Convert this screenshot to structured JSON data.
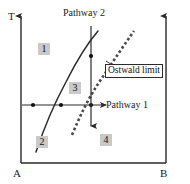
{
  "figure": {
    "type": "phase-diagram",
    "background_color": "#ffffff",
    "line_color": "#2a2a2a",
    "region_box_color": "#c9c9c9"
  },
  "axes": {
    "y_axis_label": "T",
    "x_axis_left_label": "A",
    "x_axis_right_label": "B",
    "left_axis_has_arrow": true,
    "right_axis_has_arrow": true
  },
  "regions": [
    {
      "id": "region-1",
      "label": "1"
    },
    {
      "id": "region-2",
      "label": "2"
    },
    {
      "id": "region-3",
      "label": "3"
    },
    {
      "id": "region-4",
      "label": "4"
    }
  ],
  "curves": [
    {
      "name": "solubility-curve",
      "style": "solid",
      "description": "solid boundary curve rising from lower left to upper right"
    },
    {
      "name": "ostwald-limit-curve",
      "style": "hatched-dashed",
      "description": "dashed metastable boundary curve to the right of the solubility curve"
    }
  ],
  "pathways": [
    {
      "id": "pathway-1",
      "label": "Pathway 1",
      "orientation": "horizontal",
      "arrow_direction": "right",
      "markers": 3
    },
    {
      "id": "pathway-2",
      "label": "Pathway 2",
      "orientation": "vertical",
      "arrow_direction": "down",
      "markers": 1
    }
  ],
  "annotations": [
    {
      "id": "ostwald-limit",
      "label": "Ostwald limit",
      "has_leader_line": true,
      "boxed": true
    }
  ]
}
